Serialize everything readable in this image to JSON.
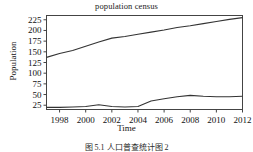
{
  "figure": {
    "title": "population census",
    "caption": "图 5.1 人口普查统计图 2",
    "background": "#ffffff",
    "line_color": "#333333",
    "axis_color": "#444444"
  },
  "chart_data": {
    "type": "line",
    "title": "population census",
    "xlabel": "Time",
    "ylabel": "Population",
    "grid": false,
    "legend": "none",
    "xlim": [
      1997,
      2012
    ],
    "ylim": [
      15,
      235
    ],
    "xticks": [
      "1998",
      "2000",
      "2002",
      "2004",
      "2006",
      "2008",
      "2010",
      "2012"
    ],
    "xtick_values": [
      1998,
      2000,
      2002,
      2004,
      2006,
      2008,
      2010,
      2012
    ],
    "yticks": [
      "25",
      "50",
      "75",
      "100",
      "125",
      "150",
      "175",
      "200",
      "225"
    ],
    "ytick_values": [
      25,
      50,
      75,
      100,
      125,
      150,
      175,
      200,
      225
    ],
    "x": [
      1997,
      1998,
      1999,
      2000,
      2001,
      2002,
      2003,
      2004,
      2005,
      2006,
      2007,
      2008,
      2009,
      2010,
      2011,
      2012
    ],
    "series": [
      {
        "name": "upper-series",
        "values": [
          137,
          146,
          153,
          163,
          173,
          182,
          186,
          191,
          196,
          201,
          207,
          211,
          216,
          221,
          226,
          230
        ]
      },
      {
        "name": "lower-series",
        "values": [
          20,
          20,
          21,
          22,
          26,
          22,
          21,
          22,
          35,
          40,
          45,
          48,
          46,
          45,
          45,
          46
        ]
      }
    ]
  }
}
